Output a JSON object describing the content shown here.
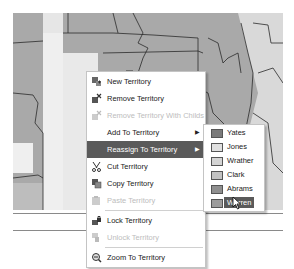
{
  "map": {
    "colors": {
      "base": "#a9a9a9",
      "light": "#d9d9d9",
      "lighter": "#efefef",
      "mid": "#bdbdbd",
      "border": "#2b2b2b"
    }
  },
  "context_menu": {
    "items": [
      {
        "label": "New Territory",
        "icon": "new-territory-icon",
        "enabled": true
      },
      {
        "label": "Remove Territory",
        "icon": "remove-territory-icon",
        "enabled": true
      },
      {
        "label": "Remove Territory With Childs",
        "icon": "remove-territory-childs-icon",
        "enabled": false
      },
      {
        "label": "Add To Territory",
        "icon": "",
        "enabled": true,
        "submenu": true
      },
      {
        "label": "Reassign To Territory",
        "icon": "",
        "enabled": true,
        "submenu": true,
        "active": true
      },
      {
        "label": "Cut Territory",
        "icon": "cut-icon",
        "enabled": true
      },
      {
        "label": "Copy Territory",
        "icon": "copy-icon",
        "enabled": true
      },
      {
        "label": "Paste Territory",
        "icon": "paste-icon",
        "enabled": false
      },
      {
        "label": "Lock Territory",
        "icon": "lock-icon",
        "enabled": true
      },
      {
        "label": "Unlock Territory",
        "icon": "unlock-icon",
        "enabled": false
      },
      {
        "label": "Zoom To Territory",
        "icon": "zoom-icon",
        "enabled": true
      }
    ],
    "submenu_arrow": "▶"
  },
  "reassign_submenu": {
    "items": [
      {
        "label": "Yates",
        "color": "#7a7a7a"
      },
      {
        "label": "Jones",
        "color": "#e0e0e0"
      },
      {
        "label": "Wrather",
        "color": "#d4d4d4"
      },
      {
        "label": "Clark",
        "color": "#c2c2c2"
      },
      {
        "label": "Abrams",
        "color": "#8f8f8f"
      },
      {
        "label": "Warren",
        "color": "#9c9c9c",
        "active": true
      }
    ]
  }
}
